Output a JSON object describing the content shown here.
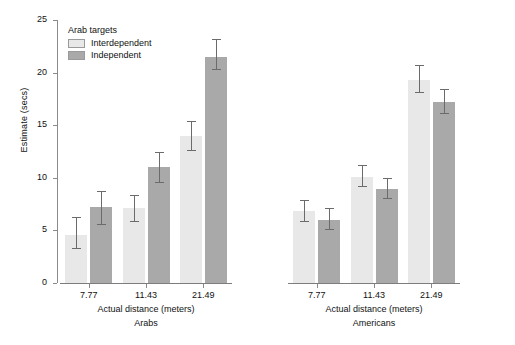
{
  "chart_data": {
    "type": "bar",
    "title": "",
    "xlabel": "Actual distance (meters)",
    "ylabel": "Estimate (secs)",
    "ylim": [
      0,
      25
    ],
    "yticks": [
      0,
      5,
      10,
      15,
      20,
      25
    ],
    "grid": false,
    "legend_position": "top-left",
    "legend_title": "Arab targets",
    "categories": [
      "7.77",
      "11.43",
      "21.49"
    ],
    "panels": [
      {
        "name": "Arabs",
        "xlabel": "Actual distance (meters)",
        "categories": [
          "7.77",
          "11.43",
          "21.49"
        ],
        "series": [
          {
            "name": "Interdependent",
            "color": "#e8e8e8",
            "values": [
              4.6,
              7.1,
              14.0
            ],
            "err_low": [
              3.3,
              5.9,
              12.6
            ],
            "err_high": [
              6.3,
              8.4,
              15.4
            ]
          },
          {
            "name": "Independent",
            "color": "#a9a9a9",
            "values": [
              7.2,
              11.0,
              21.5
            ],
            "err_low": [
              5.6,
              9.6,
              20.3
            ],
            "err_high": [
              8.7,
              12.5,
              23.2
            ]
          }
        ]
      },
      {
        "name": "Americans",
        "xlabel": "Actual distance (meters)",
        "categories": [
          "7.77",
          "11.43",
          "21.49"
        ],
        "series": [
          {
            "name": "Interdependent",
            "color": "#e8e8e8",
            "values": [
              6.8,
              10.1,
              19.3
            ],
            "err_low": [
              5.9,
              9.2,
              18.2
            ],
            "err_high": [
              7.9,
              11.2,
              20.7
            ]
          },
          {
            "name": "Independent",
            "color": "#a9a9a9",
            "values": [
              6.0,
              8.9,
              17.2
            ],
            "err_low": [
              5.1,
              8.1,
              16.2
            ],
            "err_high": [
              7.1,
              10.0,
              18.4
            ]
          }
        ]
      }
    ]
  },
  "legend": {
    "title": "Arab targets",
    "items": [
      {
        "label": "Interdependent",
        "swatch": "light"
      },
      {
        "label": "Independent",
        "swatch": "dark"
      }
    ]
  },
  "axes": {
    "y_title": "Estimate (secs)",
    "y_ticks": [
      "0",
      "5",
      "10",
      "15",
      "20",
      "25"
    ]
  }
}
